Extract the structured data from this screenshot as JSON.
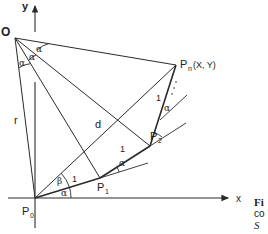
{
  "diagram": {
    "type": "geometric-construction",
    "axes": {
      "x_label": "x",
      "y_label": "y"
    },
    "points": {
      "origin_label": "O",
      "p0": "P",
      "p0_sub": "0",
      "p1": "P",
      "p1_sub": "1",
      "p2": "P",
      "p2_sub": "2",
      "pn": "P",
      "pn_sub": "n",
      "pn_coords": "(X, Y)"
    },
    "segment_labels": {
      "r": "r",
      "d": "d",
      "unit1": "1",
      "unit2": "1",
      "unit3": "1"
    },
    "angle_labels": {
      "alpha": "α",
      "beta": "β"
    },
    "ellipsis": "· · ·",
    "caption_fragment": {
      "line1": "Fi",
      "line2": "co",
      "line3": "S",
      "line4": "· ·"
    }
  },
  "colors": {
    "line": "#2a2a2a",
    "background": "#ffffff"
  }
}
